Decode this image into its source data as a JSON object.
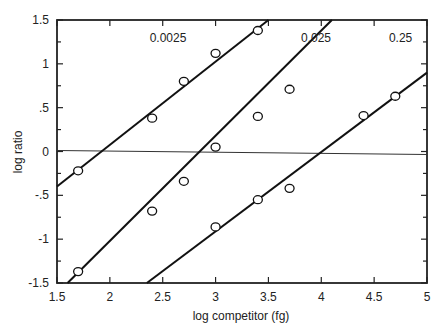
{
  "chart_data": {
    "type": "scatter",
    "title": "",
    "xlabel": "log competitor (fg)",
    "ylabel": "log ratio",
    "xlim": [
      1.5,
      5
    ],
    "ylim": [
      -1.5,
      1.5
    ],
    "x_ticks": [
      "1.5",
      "2",
      "2.5",
      "3",
      "3.5",
      "4",
      "4.5",
      "5"
    ],
    "y_ticks": [
      "1.5",
      "1",
      ".5",
      "0",
      "-.5",
      "-1",
      "-1.5"
    ],
    "grid": false,
    "reference_line": {
      "y": 0
    },
    "series": [
      {
        "name": "0.0025",
        "points": [
          [
            1.7,
            -0.22
          ],
          [
            2.4,
            0.38
          ],
          [
            2.7,
            0.8
          ],
          [
            3.0,
            1.12
          ],
          [
            3.4,
            1.38
          ]
        ],
        "fit_line": [
          [
            1.5,
            -0.4
          ],
          [
            3.5,
            1.5
          ]
        ]
      },
      {
        "name": "0.025",
        "points": [
          [
            1.7,
            -1.37
          ],
          [
            2.4,
            -0.68
          ],
          [
            2.7,
            -0.34
          ],
          [
            3.0,
            0.05
          ],
          [
            3.4,
            0.4
          ],
          [
            3.7,
            0.71
          ]
        ],
        "fit_line": [
          [
            1.6,
            -1.5
          ],
          [
            4.1,
            1.5
          ]
        ]
      },
      {
        "name": "0.25",
        "points": [
          [
            3.0,
            -0.86
          ],
          [
            3.4,
            -0.55
          ],
          [
            3.7,
            -0.42
          ],
          [
            4.4,
            0.41
          ],
          [
            4.7,
            0.63
          ]
        ],
        "fit_line": [
          [
            2.35,
            -1.5
          ],
          [
            5.0,
            0.9
          ]
        ]
      }
    ],
    "annotations": [
      {
        "text": "0.0025",
        "x": 2.55,
        "y": 1.25
      },
      {
        "text": "0.025",
        "x": 3.95,
        "y": 1.25
      },
      {
        "text": "0.25",
        "x": 4.75,
        "y": 1.25
      }
    ]
  },
  "labels": {
    "xlabel": "log competitor (fg)",
    "ylabel": "log ratio",
    "series_0": "0.0025",
    "series_1": "0.025",
    "series_2": "0.25"
  }
}
